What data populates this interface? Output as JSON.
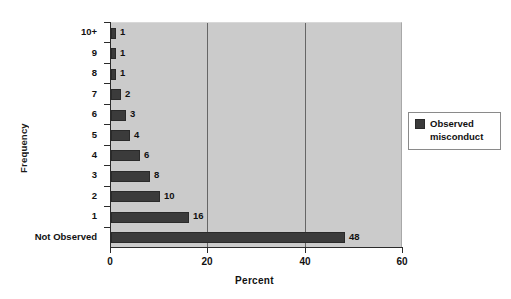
{
  "chart_data": {
    "type": "bar",
    "orientation": "horizontal",
    "title": "",
    "xlabel": "Percent",
    "ylabel": "Frequency",
    "xlim": [
      0,
      60
    ],
    "xticks": [
      0,
      20,
      40,
      60
    ],
    "gridlines": [
      20,
      40
    ],
    "grid": true,
    "categories": [
      "10+",
      "9",
      "8",
      "7",
      "6",
      "5",
      "4",
      "3",
      "2",
      "1",
      "Not Observed"
    ],
    "values": [
      1,
      1,
      1,
      2,
      3,
      4,
      6,
      8,
      10,
      16,
      48
    ],
    "data_labels": [
      "1",
      "1",
      "1",
      "2",
      "3",
      "4",
      "6",
      "8",
      "10",
      "16",
      "48"
    ],
    "series": [
      {
        "name": "Observed misconduct",
        "values": [
          1,
          1,
          1,
          2,
          3,
          4,
          6,
          8,
          10,
          16,
          48
        ],
        "color": "#3b3b3b"
      }
    ],
    "legend": {
      "position": "right",
      "entries": [
        {
          "label": "Observed misconduct",
          "label_line1": "Observed",
          "label_line2": "misconduct",
          "color": "#3b3b3b"
        }
      ]
    },
    "colors": {
      "bar": "#3b3b3b",
      "plot_background": "#cbcbcb",
      "page_background": "#ffffff",
      "axis": "#2b2b2b",
      "gridline": "#666666",
      "text": "#111111"
    }
  },
  "axes": {
    "x_title": "Percent",
    "y_title": "Frequency",
    "x_tick_labels": [
      "0",
      "20",
      "40",
      "60"
    ],
    "y_tick_labels": [
      "10+",
      "9",
      "8",
      "7",
      "6",
      "5",
      "4",
      "3",
      "2",
      "1",
      "Not Observed"
    ]
  },
  "legend_box": {
    "line1": "Observed",
    "line2": "misconduct"
  }
}
